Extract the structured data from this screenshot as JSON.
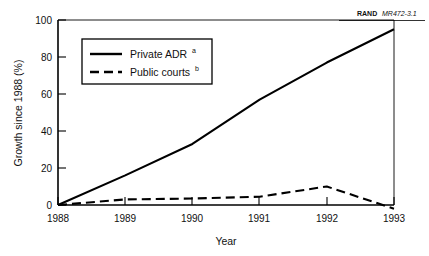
{
  "source_note": {
    "brand": "RAND",
    "document_id": "MR472-3.1"
  },
  "chart_data": {
    "type": "line",
    "title": "",
    "xlabel": "Year",
    "ylabel": "Growth since 1988 (%)",
    "x": [
      1988,
      1989,
      1990,
      1991,
      1992,
      1993
    ],
    "xticklabels": [
      "1988",
      "1989",
      "1990",
      "1991",
      "1992",
      "1993"
    ],
    "xlim": [
      1988,
      1993
    ],
    "ylim": [
      -3,
      100
    ],
    "yticks": [
      0,
      20,
      40,
      60,
      80,
      100
    ],
    "yticklabels": [
      "0",
      "20",
      "40",
      "60",
      "80",
      "100"
    ],
    "grid": false,
    "legend_position": "upper-left-inside",
    "series": [
      {
        "name": "Private ADR",
        "name_superscript": "a",
        "style": "solid",
        "color": "#000000",
        "values": [
          0,
          16,
          33,
          57,
          77,
          95
        ]
      },
      {
        "name": "Public courts",
        "name_superscript": "b",
        "style": "dashed",
        "color": "#000000",
        "values": [
          0,
          3,
          3.5,
          4.5,
          10,
          -2
        ]
      }
    ]
  }
}
